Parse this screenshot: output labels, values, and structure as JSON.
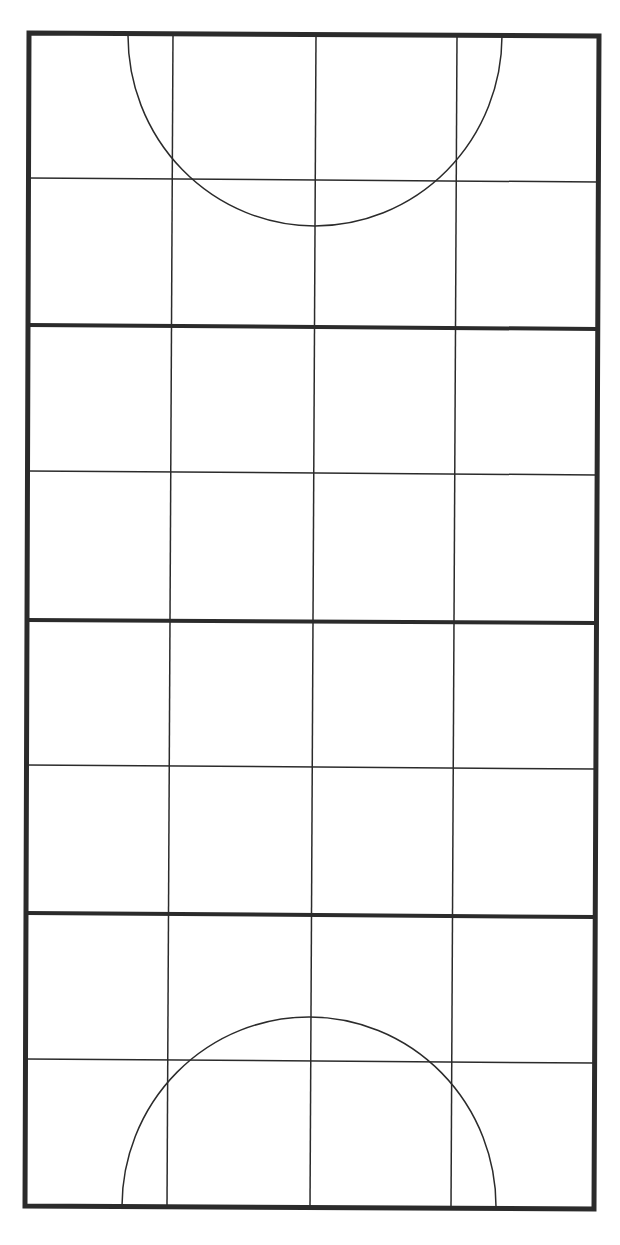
{
  "diagram": {
    "columns": 4,
    "rows": 8,
    "thick_divider_every_rows": 2,
    "colors": {
      "background": "#ffffff",
      "line": "#2b2b2b",
      "border": "#2b2b2b"
    },
    "stroke": {
      "border_width": 5,
      "thick_divider_width": 4,
      "thin_line_width": 1.5,
      "arc_width": 1.5
    },
    "outer_frame": {
      "top_left": [
        29,
        33
      ],
      "top_right": [
        599,
        36
      ],
      "bottom_right": [
        594,
        1209
      ],
      "bottom_left": [
        25,
        1206
      ]
    },
    "vertical_lines": [
      {
        "top": [
          173,
          33
        ],
        "bottom": [
          167,
          1207
        ]
      },
      {
        "top": [
          316,
          34
        ],
        "bottom": [
          310,
          1208
        ]
      },
      {
        "top": [
          457,
          35
        ],
        "bottom": [
          451,
          1208
        ]
      }
    ],
    "horizontal_lines": [
      {
        "y_left": 178,
        "y_right": 182,
        "weight": "thin"
      },
      {
        "y_left": 325,
        "y_right": 329,
        "weight": "thick"
      },
      {
        "y_left": 471,
        "y_right": 475,
        "weight": "thin"
      },
      {
        "y_left": 620,
        "y_right": 623,
        "weight": "thick"
      },
      {
        "y_left": 765,
        "y_right": 769,
        "weight": "thin"
      },
      {
        "y_left": 913,
        "y_right": 917,
        "weight": "thick"
      },
      {
        "y_left": 1059,
        "y_right": 1063,
        "weight": "thin"
      }
    ],
    "arcs": [
      {
        "position": "top",
        "start": [
          128,
          35
        ],
        "end": [
          502,
          36
        ],
        "apex": [
          315,
          226
        ]
      },
      {
        "position": "bottom",
        "start": [
          122,
          1206
        ],
        "end": [
          496,
          1207
        ],
        "apex": [
          310,
          1017
        ]
      }
    ]
  }
}
